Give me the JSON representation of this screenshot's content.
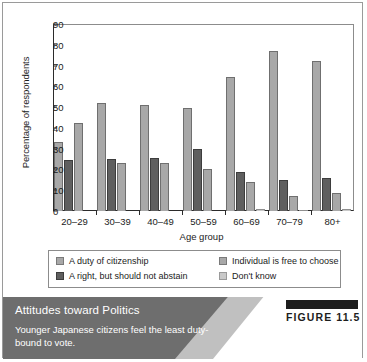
{
  "figure": {
    "badge_label": "FIGURE 11.5",
    "caption_title": "Attitudes toward Politics",
    "caption_description": "Younger Japanese citizens feel the least duty-bound to vote."
  },
  "chart_data": {
    "type": "bar",
    "title": "",
    "subtitle": "",
    "xlabel": "Age group",
    "ylabel": "Percentage of respondents",
    "categories": [
      "20–29",
      "30–39",
      "40–49",
      "50–59",
      "60–69",
      "70–79",
      "80+"
    ],
    "ylim": [
      0,
      90
    ],
    "yticks": [
      0,
      10,
      20,
      30,
      40,
      50,
      60,
      70,
      80,
      90
    ],
    "ytick_labels": [
      "0",
      "10",
      "20",
      "30",
      "40",
      "50",
      "60",
      "70",
      "80",
      "90"
    ],
    "grid": false,
    "legend_position": "bottom",
    "series": [
      {
        "name": "A duty of citizenship",
        "color": "#a8a8a8",
        "values": [
          33,
          52,
          51,
          49.5,
          64.5,
          77,
          72
        ]
      },
      {
        "name": "A right, but should not abstain",
        "color": "#5f5f5f",
        "values": [
          24.5,
          25,
          25.5,
          30,
          19,
          15,
          16
        ]
      },
      {
        "name": "Individual is free to choose",
        "color": "#a8a8a8",
        "values": [
          42.5,
          23,
          23,
          20,
          14,
          7,
          8.5
        ]
      },
      {
        "name": "Don't know",
        "color": "#c9c9c9",
        "values": [
          0,
          0,
          0,
          0,
          1,
          0.7,
          1.2
        ]
      }
    ]
  }
}
